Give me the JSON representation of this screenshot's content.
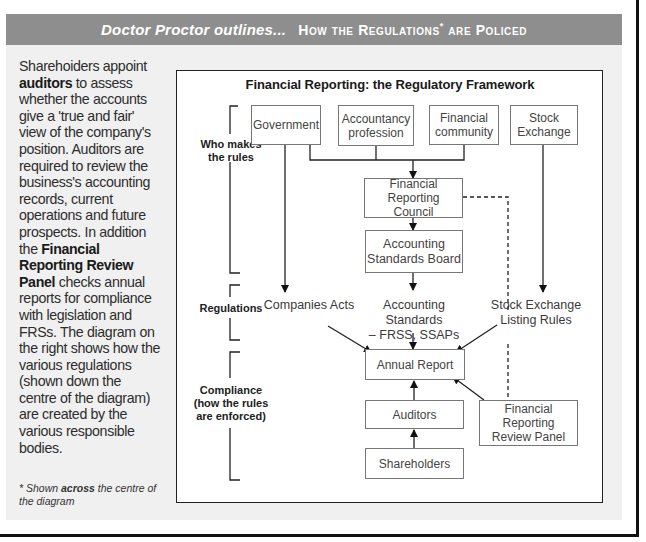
{
  "header": {
    "lead": "Doctor Proctor outlines...",
    "title_parts": [
      "How the Regulations",
      "*",
      " are Policed"
    ]
  },
  "sidebar": {
    "segments": [
      {
        "text": "Sharehoiders appoint ",
        "bold": false
      },
      {
        "text": "auditors",
        "bold": true
      },
      {
        "text": " to assess whether the accounts give a 'true and fair' view of the company's position. Auditors are required to review the business's accounting records, current operations and future prospects. In addition the ",
        "bold": false
      },
      {
        "text": "Financial Reporting Review Panel",
        "bold": true
      },
      {
        "text": " checks annual reports for compliance with legislation and FRSs. The diagram on the right shows how the various regulations (shown down the centre of the diagram) are created by the various responsible bodies.",
        "bold": false
      }
    ],
    "footnote": {
      "prefix": "* Shown ",
      "emphasis": "across",
      "suffix": " the centre of the diagram"
    }
  },
  "diagram": {
    "title": "Financial Reporting: the Regulatory Framework",
    "section_labels": {
      "rule_makers": [
        "Who makes",
        "the rules"
      ],
      "regulations": [
        "Regulations"
      ],
      "compliance": [
        "Compliance",
        "(how the rules",
        "are enforced)"
      ]
    },
    "bodies": {
      "government": "Government",
      "accountancy": [
        "Accountancy",
        "profession"
      ],
      "financial_community": [
        "Financial",
        "community"
      ],
      "stock_exchange": [
        "Stock",
        "Exchange"
      ],
      "frc": [
        "Financial Reporting",
        "Council"
      ],
      "asb": [
        "Accounting",
        "Standards Board"
      ]
    },
    "regulations": {
      "companies_acts": "Companies Acts",
      "accounting_standards": [
        "Accounting Standards",
        "– FRSS, SSAPs"
      ],
      "listing_rules": [
        "Stock Exchange",
        "Listing Rules"
      ]
    },
    "compliance": {
      "annual_report": "Annual Report",
      "auditors": "Auditors",
      "shareholders": "Shareholders",
      "frrp": [
        "Financial Reporting",
        "Review Panel"
      ]
    }
  }
}
